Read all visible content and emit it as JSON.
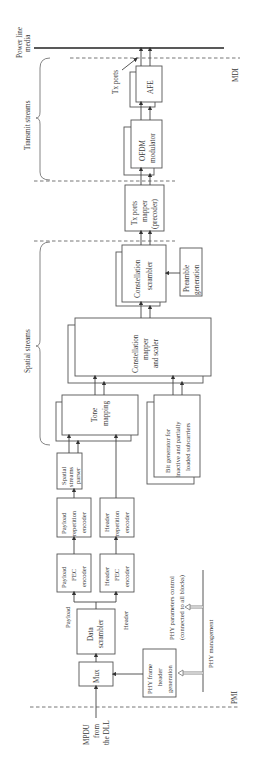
{
  "diagram": {
    "orientation": "rotated -90deg",
    "boundaries": {
      "mdi": "MDI",
      "pmi": "PMI",
      "media": "Power line media"
    },
    "groups": {
      "transmit_streams": "Transmit streams",
      "spatial_streams": "Spatial streams"
    },
    "annotations": {
      "tx_ports": "Tx ports",
      "payload": "Payload",
      "header": "Header",
      "phy_params_1": "PHY parameters control",
      "phy_params_2": "(connected to all blocks)",
      "phy_management": "PHY management",
      "mpdu_1": "MPDU",
      "mpdu_2": "from",
      "mpdu_3": "the DLL"
    },
    "blocks": {
      "afe": [
        "AFE"
      ],
      "ofdm": [
        "OFDM",
        "modulator"
      ],
      "txmapper": [
        "Tx ports",
        "mapper",
        "(precoder)"
      ],
      "constscr": [
        "Constellation",
        "scrambler"
      ],
      "preamble": [
        "Preamble",
        "generation"
      ],
      "constmap": [
        "Constellation",
        "mapper",
        "and scaler"
      ],
      "tone": [
        "Tone",
        "mapping"
      ],
      "bitgen": [
        "Bit generator for",
        "inactive and partially",
        "loaded subcarriers"
      ],
      "ssparser": [
        "Spatial",
        "streams",
        "parser"
      ],
      "payrep": [
        "Payload",
        "repetition",
        "encoder"
      ],
      "hdrrep": [
        "Header",
        "repetition",
        "encoder"
      ],
      "payfec": [
        "Payload",
        "FEC",
        "encoder"
      ],
      "hdrfec": [
        "Header",
        "FEC",
        "encoder"
      ],
      "datascr": [
        "Data",
        "scrambler"
      ],
      "mux": [
        "Mux"
      ],
      "phyframe": [
        "PHY frame",
        "header",
        "generation"
      ]
    }
  }
}
